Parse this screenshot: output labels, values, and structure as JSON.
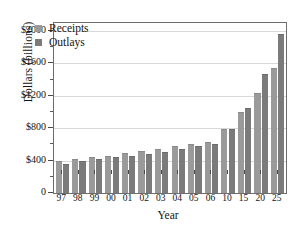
{
  "chart_data": {
    "type": "bar",
    "title": "",
    "xlabel": "Year",
    "ylabel": "Dollars (billions)",
    "categories": [
      "97",
      "98",
      "99",
      "00",
      "01",
      "02",
      "03",
      "04",
      "05",
      "06",
      "10",
      "15",
      "20",
      "25"
    ],
    "series": [
      {
        "name": "Receipts",
        "color": "#9a9a9a",
        "values": [
          400,
          425,
          445,
          460,
          500,
          520,
          545,
          580,
          600,
          625,
          790,
          1000,
          1240,
          1550
        ]
      },
      {
        "name": "Outlays",
        "color": "#7b7b7b",
        "values": [
          360,
          395,
          415,
          440,
          460,
          480,
          510,
          545,
          580,
          605,
          785,
          1055,
          1465,
          1970
        ]
      }
    ],
    "ylim": [
      0,
      2100
    ],
    "ytick_values": [
      0,
      400,
      800,
      1200,
      1600,
      2000
    ],
    "ytick_labels": [
      "0",
      "$400",
      "$800",
      "$1200",
      "$1600",
      "$2000"
    ],
    "yminor_tick_values": [
      200,
      600,
      1000,
      1400,
      1800
    ],
    "gridline_values": [
      400,
      800,
      1200,
      1600,
      2000
    ],
    "grid": true,
    "legend_position": "upper-left-inside",
    "legend_entries": [
      "Receipts",
      "Outlays"
    ]
  }
}
